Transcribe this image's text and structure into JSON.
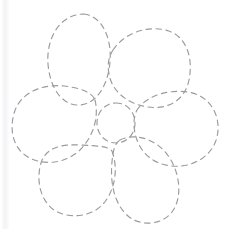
{
  "image": {
    "title": "Flower Outline Tracing Worksheet",
    "description": "Hand-drawn dashed outline of a five-petal flower with a round center, drawn in faint gray dashes on plain white paper",
    "width": 227,
    "height": 229
  },
  "canvas": {
    "background_color": "#ffffff",
    "scan_artifact": {
      "name": "left-edge-scan-band",
      "color": "#f3f3f5",
      "x": 2,
      "width": 7
    }
  },
  "style": {
    "stroke_color": "#9a9aa0",
    "stroke_width": 1.15,
    "dash_length": 5.5,
    "dash_gap": 4.5,
    "line_style": "dashed"
  },
  "drawing": {
    "subject": "flower",
    "petal_count": 5,
    "has_center_circle": true,
    "parts": [
      {
        "name": "petal-top-left",
        "label": "Top left petal",
        "cx": 80,
        "cy": 60,
        "rx": 32,
        "ry": 46,
        "rotation": -6,
        "path": "M 84 14 C 102 16 112 38 110 62 C 108 86 96 104 80 105 C 62 106 50 88 48 64 C 46 38 60 14 84 14 Z"
      },
      {
        "name": "petal-top-right",
        "label": "Top right petal",
        "cx": 150,
        "cy": 66,
        "rx": 42,
        "ry": 39,
        "rotation": 12,
        "path": "M 113 50 C 126 31 150 25 169 31 C 188 38 193 60 189 80 C 185 100 168 110 148 107 C 128 104 112 92 109 74 C 107 64 109 56 113 50 Z"
      },
      {
        "name": "petal-left",
        "label": "Left petal",
        "cx": 54,
        "cy": 123,
        "rx": 43,
        "ry": 38,
        "rotation": -8,
        "path": "M 95 100 C 99 116 94 136 80 150 C 64 165 40 166 25 155 C 11 145 9 124 16 108 C 24 91 44 84 64 86 C 80 88 92 92 95 100 Z"
      },
      {
        "name": "petal-right",
        "label": "Right petal",
        "cx": 176,
        "cy": 128,
        "rx": 43,
        "ry": 38,
        "rotation": 6,
        "path": "M 137 110 C 146 96 168 89 188 92 C 207 95 219 111 218 130 C 217 150 201 164 181 166 C 160 168 143 157 137 140 C 133 129 133 118 137 110 Z"
      },
      {
        "name": "petal-bottom-left",
        "label": "Bottom left petal",
        "cx": 78,
        "cy": 183,
        "rx": 38,
        "ry": 36,
        "rotation": -4,
        "path": "M 112 151 C 118 167 116 188 104 203 C 91 218 68 219 54 210 C 40 200 36 180 41 163 C 46 147 62 144 81 145 C 97 146 108 146 112 151 Z"
      },
      {
        "name": "petal-bottom-right",
        "label": "Bottom right petal",
        "cx": 150,
        "cy": 180,
        "rx": 32,
        "ry": 46,
        "rotation": 4,
        "path": "M 120 140 C 136 132 158 140 169 157 C 181 175 182 199 172 212 C 162 225 141 227 128 216 C 114 204 110 182 112 162 C 113 150 115 143 120 140 Z"
      },
      {
        "name": "flower-center-circle",
        "label": "Flower center",
        "cx": 116,
        "cy": 123,
        "rx": 19,
        "ry": 20,
        "rotation": 0,
        "path": "M 116 103 C 127 103 135 112 135 123 C 135 134 127 143 116 143 C 105 143 97 134 97 123 C 97 112 105 103 116 103 Z"
      }
    ]
  }
}
